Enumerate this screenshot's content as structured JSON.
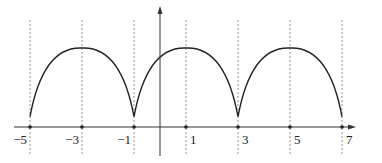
{
  "chart_data": {
    "type": "line",
    "title": "",
    "xlabel": "",
    "ylabel": "",
    "grid": false,
    "legend": null,
    "x_ticks": [
      -5,
      -3,
      -1,
      1,
      3,
      5,
      7
    ],
    "tick_labels": [
      "−5",
      "−3",
      "−1",
      "1",
      "3",
      "5",
      "7"
    ],
    "xlim": [
      -5.5,
      7.4
    ],
    "dashed_verticals_at": [
      -5,
      -3,
      -1,
      1,
      3,
      5,
      7
    ],
    "series": [
      {
        "name": "f(x)",
        "points": [
          {
            "x": -5,
            "y": 0.13
          },
          {
            "x": -3,
            "y": 1.0
          },
          {
            "x": -1,
            "y": 0.13
          },
          {
            "x": 1,
            "y": 1.0
          },
          {
            "x": 3,
            "y": 0.13
          },
          {
            "x": 5,
            "y": 1.0
          },
          {
            "x": 7,
            "y": 0.13
          }
        ]
      }
    ]
  },
  "colors": {
    "curve": "#222222",
    "axis": "#333333",
    "dashed": "#777777",
    "background": "#ffffff"
  }
}
